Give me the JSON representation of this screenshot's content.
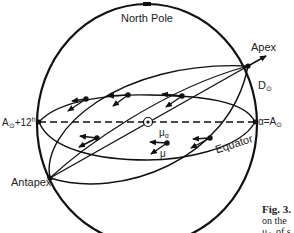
{
  "diagram": {
    "labels": {
      "north_pole": "North Pole",
      "apex": "Apex",
      "antapex": "Antapex",
      "d_sun": "D",
      "d_sun_sub": "⊙",
      "alpha_eq_a": "α=A",
      "alpha_eq_a_sub": "⊙",
      "a_plus_12": "A",
      "a_plus_12_sub": "⊙",
      "a_plus_12_rest": "+12",
      "a_plus_12_sup": "h",
      "mu_alpha": "μ",
      "mu_alpha_sub": "α",
      "mu": "μ",
      "equator": "Equator"
    },
    "caption": {
      "fig": "Fig. 3.",
      "line2": "on the",
      "line3": "μ",
      "line3_sub": "⊙",
      "line3_rest": " of s"
    },
    "colors": {
      "ink": "#111111",
      "background": "#ffffff"
    }
  }
}
